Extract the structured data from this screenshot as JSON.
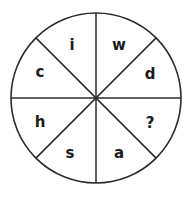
{
  "figure": {
    "type": "circle-divided-into-sectors",
    "shape": "circle",
    "sector_count": 8,
    "stroke_color": "#2b2b2b",
    "fill_color": "#ffffff",
    "background_color": "#ffffff",
    "circle": {
      "center_x": 96,
      "center_y": 98,
      "radius": 85,
      "stroke_width": 1.6
    },
    "divider_lines": [
      {
        "name": "vertical-diameter",
        "angle_deg": 90
      },
      {
        "name": "horizontal-diameter",
        "angle_deg": 0
      },
      {
        "name": "diagonal-diameter-nw-se",
        "angle_deg": 135
      },
      {
        "name": "diagonal-diameter-ne-sw",
        "angle_deg": 45
      }
    ],
    "sectors": [
      {
        "position": "top-left",
        "label": "i",
        "center_angle_deg": 112.5,
        "label_x": 72,
        "label_y": 45
      },
      {
        "position": "top-right",
        "label": "w",
        "center_angle_deg": 67.5,
        "label_x": 119,
        "label_y": 45
      },
      {
        "position": "right-upper",
        "label": "d",
        "center_angle_deg": 22.5,
        "label_x": 150,
        "label_y": 74
      },
      {
        "position": "right-lower",
        "label": "?",
        "center_angle_deg": -22.5,
        "label_x": 150,
        "label_y": 123
      },
      {
        "position": "bottom-right",
        "label": "a",
        "center_angle_deg": -67.5,
        "label_x": 119,
        "label_y": 153
      },
      {
        "position": "bottom-left",
        "label": "s",
        "center_angle_deg": -112.5,
        "label_x": 70,
        "label_y": 153
      },
      {
        "position": "left-lower",
        "label": "h",
        "center_angle_deg": -157.5,
        "label_x": 40,
        "label_y": 122
      },
      {
        "position": "left-upper",
        "label": "c",
        "center_angle_deg": 157.5,
        "label_x": 40,
        "label_y": 72
      }
    ]
  }
}
